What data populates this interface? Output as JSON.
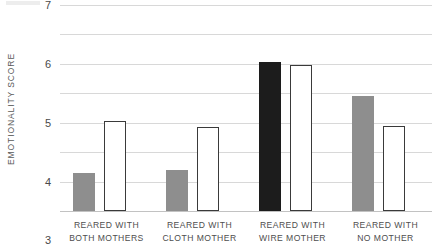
{
  "chart_data": {
    "type": "bar",
    "title": "",
    "xlabel": "",
    "ylabel": "EMOTIONALITY SCORE",
    "ylim": [
      0,
      7
    ],
    "yticks": [
      0,
      1,
      2,
      3,
      4,
      5,
      6,
      7
    ],
    "ytick_labels": [
      "0",
      "1",
      "2",
      "3",
      "4",
      "5",
      "6",
      "7"
    ],
    "grid": "horizontal",
    "legend": "none",
    "categories": [
      "REARED WITH BOTH MOTHERS",
      "REARED WITH CLOTH MOTHER",
      "REARED WITH WIRE MOTHER",
      "REARED WITH NO MOTHER"
    ],
    "category_lines": [
      {
        "line1": "REARED WITH",
        "line2": "BOTH MOTHERS"
      },
      {
        "line1": "REARED WITH",
        "line2": "CLOTH MOTHER"
      },
      {
        "line1": "REARED WITH",
        "line2": "WIRE MOTHER"
      },
      {
        "line1": "REARED WITH",
        "line2": "NO MOTHER"
      }
    ],
    "series": [
      {
        "name": "left-bar",
        "style": "filled",
        "values": [
          1.3,
          1.4,
          5.05,
          3.9
        ],
        "colors": [
          "#8e8e8e",
          "#8e8e8e",
          "#1c1c1c",
          "#8e8e8e"
        ]
      },
      {
        "name": "right-bar",
        "style": "outlined",
        "values": [
          3.05,
          2.85,
          4.95,
          2.9
        ],
        "colors": [
          "#ffffff",
          "#ffffff",
          "#ffffff",
          "#ffffff"
        ]
      }
    ],
    "colors": {
      "gray_bar": "#8e8e8e",
      "black_bar": "#1c1c1c",
      "outline_bar_fill": "#ffffff",
      "outline_bar_stroke": "#3a3a3a",
      "gridline": "#d8d8d8",
      "baseline": "#c2c2c2",
      "text": "#4a4a4a",
      "background": "#ffffff"
    }
  }
}
